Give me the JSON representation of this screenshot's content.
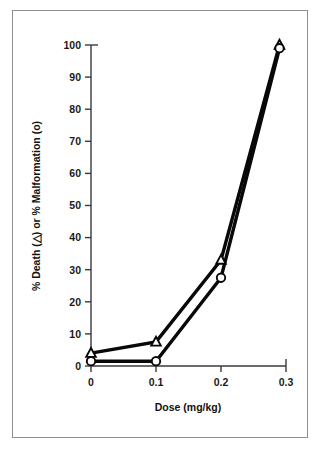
{
  "chart_data": {
    "type": "line",
    "title": "",
    "xlabel": "Dose (mg/kg)",
    "ylabel": "% Death (△) or % Malformation (o)",
    "xlim": [
      0,
      0.3
    ],
    "ylim": [
      0,
      100
    ],
    "grid": false,
    "legend": "none",
    "xticks": [
      "0",
      "0.1",
      "0.2",
      "0.3"
    ],
    "xtick_values": [
      0,
      0.1,
      0.2,
      0.3
    ],
    "yticks": [
      "0",
      "10",
      "20",
      "30",
      "40",
      "50",
      "60",
      "70",
      "80",
      "90",
      "100"
    ],
    "ytick_values": [
      0,
      10,
      20,
      30,
      40,
      50,
      60,
      70,
      80,
      90,
      100
    ],
    "series": [
      {
        "name": "% Death",
        "marker": "triangle-open",
        "color": "#080808",
        "x": [
          0,
          0.1,
          0.2,
          0.29
        ],
        "values": [
          4,
          7.5,
          33,
          100
        ]
      },
      {
        "name": "% Malformation",
        "marker": "circle-open",
        "color": "#080808",
        "x": [
          0,
          0.1,
          0.2,
          0.29
        ],
        "values": [
          1.5,
          1.5,
          27.5,
          99
        ]
      }
    ]
  },
  "figure": {
    "border_color": "#8e8e8e",
    "background": "#ffffff",
    "axis_color": "#3a3a3a",
    "line_color": "#080808",
    "marker_fill": "#ffffff"
  }
}
